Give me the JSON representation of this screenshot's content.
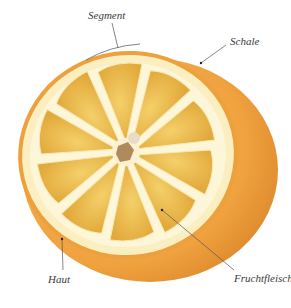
{
  "diagram": {
    "labels": {
      "segment": "Segment",
      "schale": "Schale",
      "haut": "Haut",
      "fruchtfleisch": "Fruchtfleisch"
    },
    "segment_count": 10,
    "colors": {
      "peel_outer": "#e8942c",
      "peel_side": "#f0a040",
      "pith": "#fbf0c4",
      "segment_flesh": "#e9b43c",
      "segment_light": "#f2cf63",
      "leader_line": "#555555",
      "label_text": "#3a3a3a"
    }
  }
}
